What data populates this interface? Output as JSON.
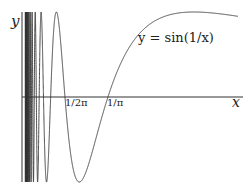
{
  "chart_data": {
    "type": "line",
    "title": "",
    "function": "y = sin(1/x)",
    "xlabel": "x",
    "ylabel": "y",
    "xlim": [
      0,
      0.8
    ],
    "ylim": [
      -1,
      1
    ],
    "grid": false,
    "legend": "none",
    "xtick_labels": [
      "1/2π",
      "1/π"
    ],
    "xtick_values": [
      0.159,
      0.318
    ],
    "series": [
      {
        "name": "y = sin(1/x)",
        "color": "#333333"
      }
    ],
    "annotation": "y = sin(1/x)"
  },
  "labels": {
    "y_axis": "y",
    "x_axis": "x",
    "curve": "y = sin(1/x)",
    "tick1": "1/2π",
    "tick2": "1/π"
  }
}
